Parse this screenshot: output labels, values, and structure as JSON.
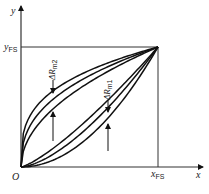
{
  "diagram": {
    "axes": {
      "x_label": "x",
      "y_label": "y",
      "origin_label": "O",
      "x_fs_label": {
        "main": "x",
        "sub": "FS"
      },
      "y_fs_label": {
        "main": "y",
        "sub": "FS"
      }
    },
    "curves": {
      "upper_shapes": [
        0.64,
        0.57,
        0.49
      ],
      "lower_shapes": [
        0.16,
        0.11,
        0.06
      ]
    },
    "annotations": [
      {
        "id": "dRm2",
        "main": "ΔR",
        "sub": "m2",
        "x_fraction": 0.24
      },
      {
        "id": "dRm1",
        "main": "ΔR",
        "sub": "m1",
        "x_fraction": 0.63
      }
    ],
    "caption": "",
    "colors": {
      "line": "#111111",
      "frame": "#333333"
    }
  }
}
